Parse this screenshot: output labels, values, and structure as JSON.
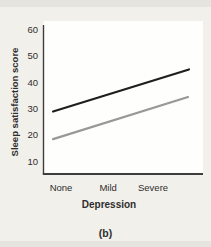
{
  "figure": {
    "panel_label": "(b)"
  },
  "colors": {
    "background": "#f2f0ea",
    "edge_strip": "#e6e4df",
    "panel": "#fefefd",
    "axis": "#3d3d3d",
    "text": "#2e2e2e"
  },
  "chart_data": {
    "type": "line",
    "title": "",
    "xlabel": "Depression",
    "ylabel": "Sleep satisfaction score",
    "categories": [
      "None",
      "Mild",
      "Severe"
    ],
    "category_x_frac": [
      0.11,
      0.405,
      0.687
    ],
    "yticks": [
      60,
      50,
      40,
      30,
      20,
      10
    ],
    "ylim": [
      5,
      62
    ],
    "grid": false,
    "legend": "none",
    "series": [
      {
        "name": "upper-line",
        "color": "#1e1e1e",
        "stroke_width": 2.2,
        "x_frac_start": 0.06,
        "x_frac_end": 0.912,
        "value_start": 29,
        "value_end": 45,
        "values_at_categories": [
          30,
          35.5,
          41
        ]
      },
      {
        "name": "lower-line",
        "color": "#9a9894",
        "stroke_width": 2.2,
        "x_frac_start": 0.06,
        "x_frac_end": 0.906,
        "value_start": 18.5,
        "value_end": 34.5,
        "values_at_categories": [
          19.5,
          25,
          30.5
        ]
      }
    ]
  }
}
